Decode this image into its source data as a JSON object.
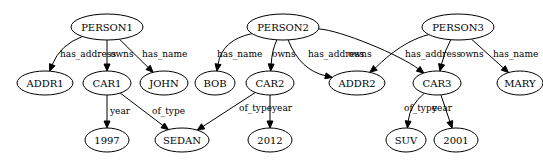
{
  "graph": {
    "nodes": [
      {
        "id": "PERSON1",
        "label": "PERSON1"
      },
      {
        "id": "PERSON2",
        "label": "PERSON2"
      },
      {
        "id": "PERSON3",
        "label": "PERSON3"
      },
      {
        "id": "ADDR1",
        "label": "ADDR1"
      },
      {
        "id": "CAR1",
        "label": "CAR1"
      },
      {
        "id": "JOHN",
        "label": "JOHN"
      },
      {
        "id": "BOB",
        "label": "BOB"
      },
      {
        "id": "CAR2",
        "label": "CAR2"
      },
      {
        "id": "ADDR2",
        "label": "ADDR2"
      },
      {
        "id": "CAR3",
        "label": "CAR3"
      },
      {
        "id": "MARY",
        "label": "MARY"
      },
      {
        "id": "Y1997",
        "label": "1997"
      },
      {
        "id": "SEDAN",
        "label": "SEDAN"
      },
      {
        "id": "Y2012",
        "label": "2012"
      },
      {
        "id": "SUV",
        "label": "SUV"
      },
      {
        "id": "Y2001",
        "label": "2001"
      }
    ],
    "edges": [
      {
        "from": "PERSON1",
        "to": "ADDR1",
        "label": "has_address"
      },
      {
        "from": "PERSON1",
        "to": "CAR1",
        "label": "owns"
      },
      {
        "from": "PERSON1",
        "to": "JOHN",
        "label": "has_name"
      },
      {
        "from": "PERSON2",
        "to": "BOB",
        "label": "has_name"
      },
      {
        "from": "PERSON2",
        "to": "CAR2",
        "label": "owns"
      },
      {
        "from": "PERSON2",
        "to": "ADDR2",
        "label": "has_address"
      },
      {
        "from": "PERSON2",
        "to": "CAR3",
        "label": "owns"
      },
      {
        "from": "PERSON3",
        "to": "ADDR2",
        "label": "has_address"
      },
      {
        "from": "PERSON3",
        "to": "CAR3",
        "label": "owns"
      },
      {
        "from": "PERSON3",
        "to": "MARY",
        "label": "has_name"
      },
      {
        "from": "CAR1",
        "to": "Y1997",
        "label": "year"
      },
      {
        "from": "CAR1",
        "to": "SEDAN",
        "label": "of_type"
      },
      {
        "from": "CAR2",
        "to": "SEDAN",
        "label": "of_type"
      },
      {
        "from": "CAR2",
        "to": "Y2012",
        "label": "year"
      },
      {
        "from": "CAR3",
        "to": "SUV",
        "label": "of_type"
      },
      {
        "from": "CAR3",
        "to": "Y2001",
        "label": "year"
      }
    ]
  }
}
